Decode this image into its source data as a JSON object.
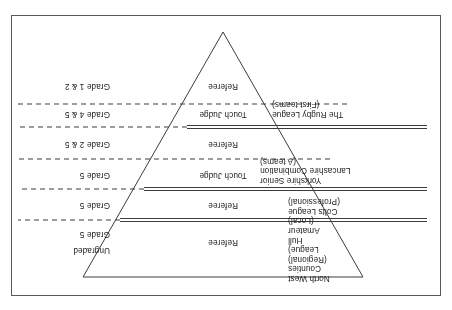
{
  "figure": {
    "orientation": "rotated-180",
    "shape": "inverted-triangle",
    "frame_color": "#5a5a5a",
    "line_color": "#3c3c3c",
    "text_color": "#1b1b1b",
    "bands": [
      {
        "id": "band-rugby-league",
        "left_label": "The Rugby League\n(First teams)",
        "center_label_lower": "Referee",
        "center_label_upper": "Touch Judge",
        "right_label_lower": "Grade 1 & 2",
        "right_label_upper": "Grade 4 & 5"
      },
      {
        "id": "band-yorkshire-lancashire",
        "left_label": "Yorkshire Senior\nLancashire Combination\n(A teams)",
        "center_label_lower": "Referee",
        "center_label_upper": "Touch Judge",
        "right_label_lower": "Grade 2 & 5",
        "right_label_upper": "Grade 5"
      },
      {
        "id": "band-colts-league",
        "left_label": "Colts League\n(Professional)",
        "center_label": "Referee",
        "right_label": "Grade 5"
      },
      {
        "id": "band-north-west-counties",
        "left_label": "North West\nCounties\n(Regional)\nLeague)\nHull\nAmateur\n(Local)",
        "center_label": "Referee",
        "right_label_lower": "Grade 5",
        "right_label_upper": "Ungraded"
      }
    ],
    "left_labels": [
      "North West\nCounties\n(Regional)\nLeague)\nHull\nAmateur\n(Local)",
      "Colts League\n(Professional)",
      "Yorkshire Senior\nLancashire Combination\n(A teams)",
      "The Rugby League\n(First teams)"
    ],
    "center_labels": [
      "Referee",
      "Referee",
      "Touch Judge",
      "Referee",
      "Touch Judge",
      "Referee"
    ],
    "right_labels": [
      "Ungraded",
      "Grade 5",
      "Grade 5",
      "Grade 5",
      "Grade 2 & 5",
      "Grade 4 & 5",
      "Grade 1 & 2"
    ]
  }
}
